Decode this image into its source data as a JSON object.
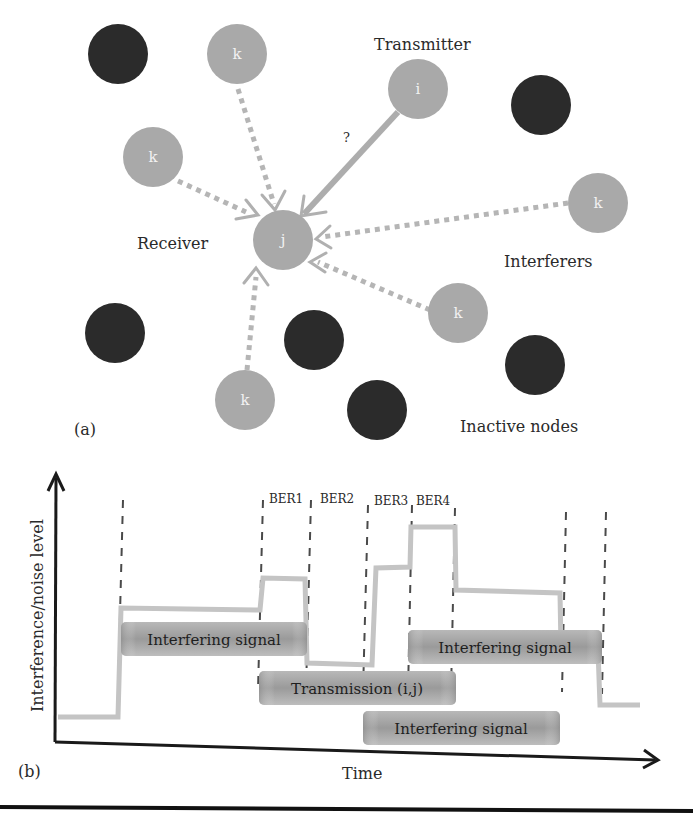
{
  "panel_a": {
    "label": "(a)",
    "labels": {
      "transmitter": "Transmitter",
      "receiver": "Receiver",
      "interferers": "Interferers",
      "inactive": "Inactive nodes",
      "question": "?"
    },
    "nodes": [
      {
        "id": "inactive-1",
        "type": "inactive",
        "label": "",
        "x": 118,
        "y": 54
      },
      {
        "id": "k-top",
        "type": "interferer",
        "label": "k",
        "x": 237,
        "y": 54
      },
      {
        "id": "i",
        "type": "transmitter",
        "label": "i",
        "x": 418,
        "y": 89
      },
      {
        "id": "inactive-2",
        "type": "inactive",
        "label": "",
        "x": 541,
        "y": 105
      },
      {
        "id": "k-left",
        "type": "interferer",
        "label": "k",
        "x": 153,
        "y": 157
      },
      {
        "id": "k-right",
        "type": "interferer",
        "label": "k",
        "x": 598,
        "y": 203
      },
      {
        "id": "j",
        "type": "receiver",
        "label": "j",
        "x": 283,
        "y": 240
      },
      {
        "id": "k-midright",
        "type": "interferer",
        "label": "k",
        "x": 458,
        "y": 313
      },
      {
        "id": "inactive-3",
        "type": "inactive",
        "label": "",
        "x": 115,
        "y": 333
      },
      {
        "id": "inactive-4",
        "type": "inactive",
        "label": "",
        "x": 314,
        "y": 340
      },
      {
        "id": "inactive-5",
        "type": "inactive",
        "label": "",
        "x": 535,
        "y": 365
      },
      {
        "id": "k-bottom",
        "type": "interferer",
        "label": "k",
        "x": 245,
        "y": 400
      },
      {
        "id": "inactive-6",
        "type": "inactive",
        "label": "",
        "x": 377,
        "y": 410
      }
    ],
    "colors": {
      "active_node": "#a9a9a9",
      "inactive_node": "#2b2b2b",
      "link": "#b5b5b5"
    }
  },
  "panel_b": {
    "label": "(b)",
    "ylabel": "Interference/noise level",
    "xlabel": "Time",
    "ber_labels": [
      "BER1",
      "BER2",
      "BER3",
      "BER4"
    ],
    "bars": [
      {
        "id": "interfering-1",
        "label": "Interfering signal"
      },
      {
        "id": "transmission",
        "label": "Transmission (i,j)"
      },
      {
        "id": "interfering-2",
        "label": "Interfering signal"
      },
      {
        "id": "interfering-3",
        "label": "Interfering signal"
      }
    ],
    "colors": {
      "level_line": "#c4c4c4",
      "bar_dark": "#8f8f8f",
      "bar_light": "#c9c9c9",
      "axis": "#1a1a1a",
      "dash": "#4a4a4a"
    }
  }
}
